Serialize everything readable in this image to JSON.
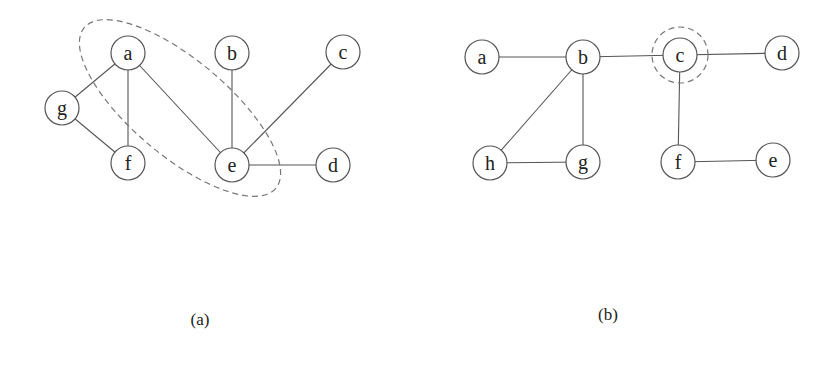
{
  "figures": [
    {
      "id": "a",
      "caption": "(a)",
      "caption_pos": [
        200,
        325
      ],
      "nodes": [
        {
          "label": "a",
          "x": 128,
          "y": 53
        },
        {
          "label": "b",
          "x": 232,
          "y": 53
        },
        {
          "label": "c",
          "x": 343,
          "y": 52
        },
        {
          "label": "g",
          "x": 62,
          "y": 108
        },
        {
          "label": "f",
          "x": 128,
          "y": 163
        },
        {
          "label": "e",
          "x": 232,
          "y": 165
        },
        {
          "label": "d",
          "x": 333,
          "y": 165
        }
      ],
      "edges": [
        [
          "a",
          "g"
        ],
        [
          "a",
          "f"
        ],
        [
          "a",
          "e"
        ],
        [
          "g",
          "f"
        ],
        [
          "b",
          "e"
        ],
        [
          "c",
          "e"
        ],
        [
          "e",
          "d"
        ]
      ],
      "highlight": {
        "shape": "ellipse",
        "cx": 180,
        "cy": 108,
        "rx": 125,
        "ry": 48,
        "rotate": 40,
        "contains": [
          "a",
          "e"
        ]
      }
    },
    {
      "id": "b",
      "caption": "(b)",
      "caption_pos": [
        608,
        320
      ],
      "nodes": [
        {
          "label": "a",
          "x": 482,
          "y": 57
        },
        {
          "label": "b",
          "x": 583,
          "y": 57
        },
        {
          "label": "c",
          "x": 680,
          "y": 55
        },
        {
          "label": "d",
          "x": 782,
          "y": 53
        },
        {
          "label": "h",
          "x": 490,
          "y": 163
        },
        {
          "label": "g",
          "x": 583,
          "y": 162
        },
        {
          "label": "f",
          "x": 678,
          "y": 162
        },
        {
          "label": "e",
          "x": 773,
          "y": 160
        }
      ],
      "edges": [
        [
          "a",
          "b"
        ],
        [
          "b",
          "c"
        ],
        [
          "c",
          "d"
        ],
        [
          "b",
          "h"
        ],
        [
          "b",
          "g"
        ],
        [
          "h",
          "g"
        ],
        [
          "c",
          "f"
        ],
        [
          "f",
          "e"
        ]
      ],
      "highlight": {
        "shape": "circle",
        "cx": 680,
        "cy": 55,
        "r": 28,
        "contains": [
          "c"
        ]
      }
    }
  ],
  "style": {
    "node_radius": 17,
    "edge_color": "#555555",
    "dash_color": "#777777"
  }
}
